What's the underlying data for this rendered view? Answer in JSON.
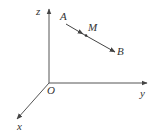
{
  "diagram": {
    "type": "3d-coordinate-axes",
    "colors": {
      "line": "#444444",
      "text": "#333333",
      "background": "#ffffff"
    },
    "axes": {
      "origin": {
        "label": "O",
        "x": 49,
        "y": 83
      },
      "z": {
        "label": "z",
        "end": [
          49,
          8
        ]
      },
      "y": {
        "label": "y",
        "end": [
          148,
          83
        ]
      },
      "x": {
        "label": "x",
        "end": [
          16,
          120
        ]
      }
    },
    "points": {
      "A": {
        "label": "A",
        "x": 66,
        "y": 23
      },
      "M": {
        "label": "M",
        "x": 86,
        "y": 35
      },
      "B": {
        "label": "B",
        "x": 115,
        "y": 51
      }
    },
    "segment": {
      "from": "A",
      "to": "B",
      "through": "M",
      "arrows": [
        "A->M",
        "M->B"
      ]
    }
  }
}
